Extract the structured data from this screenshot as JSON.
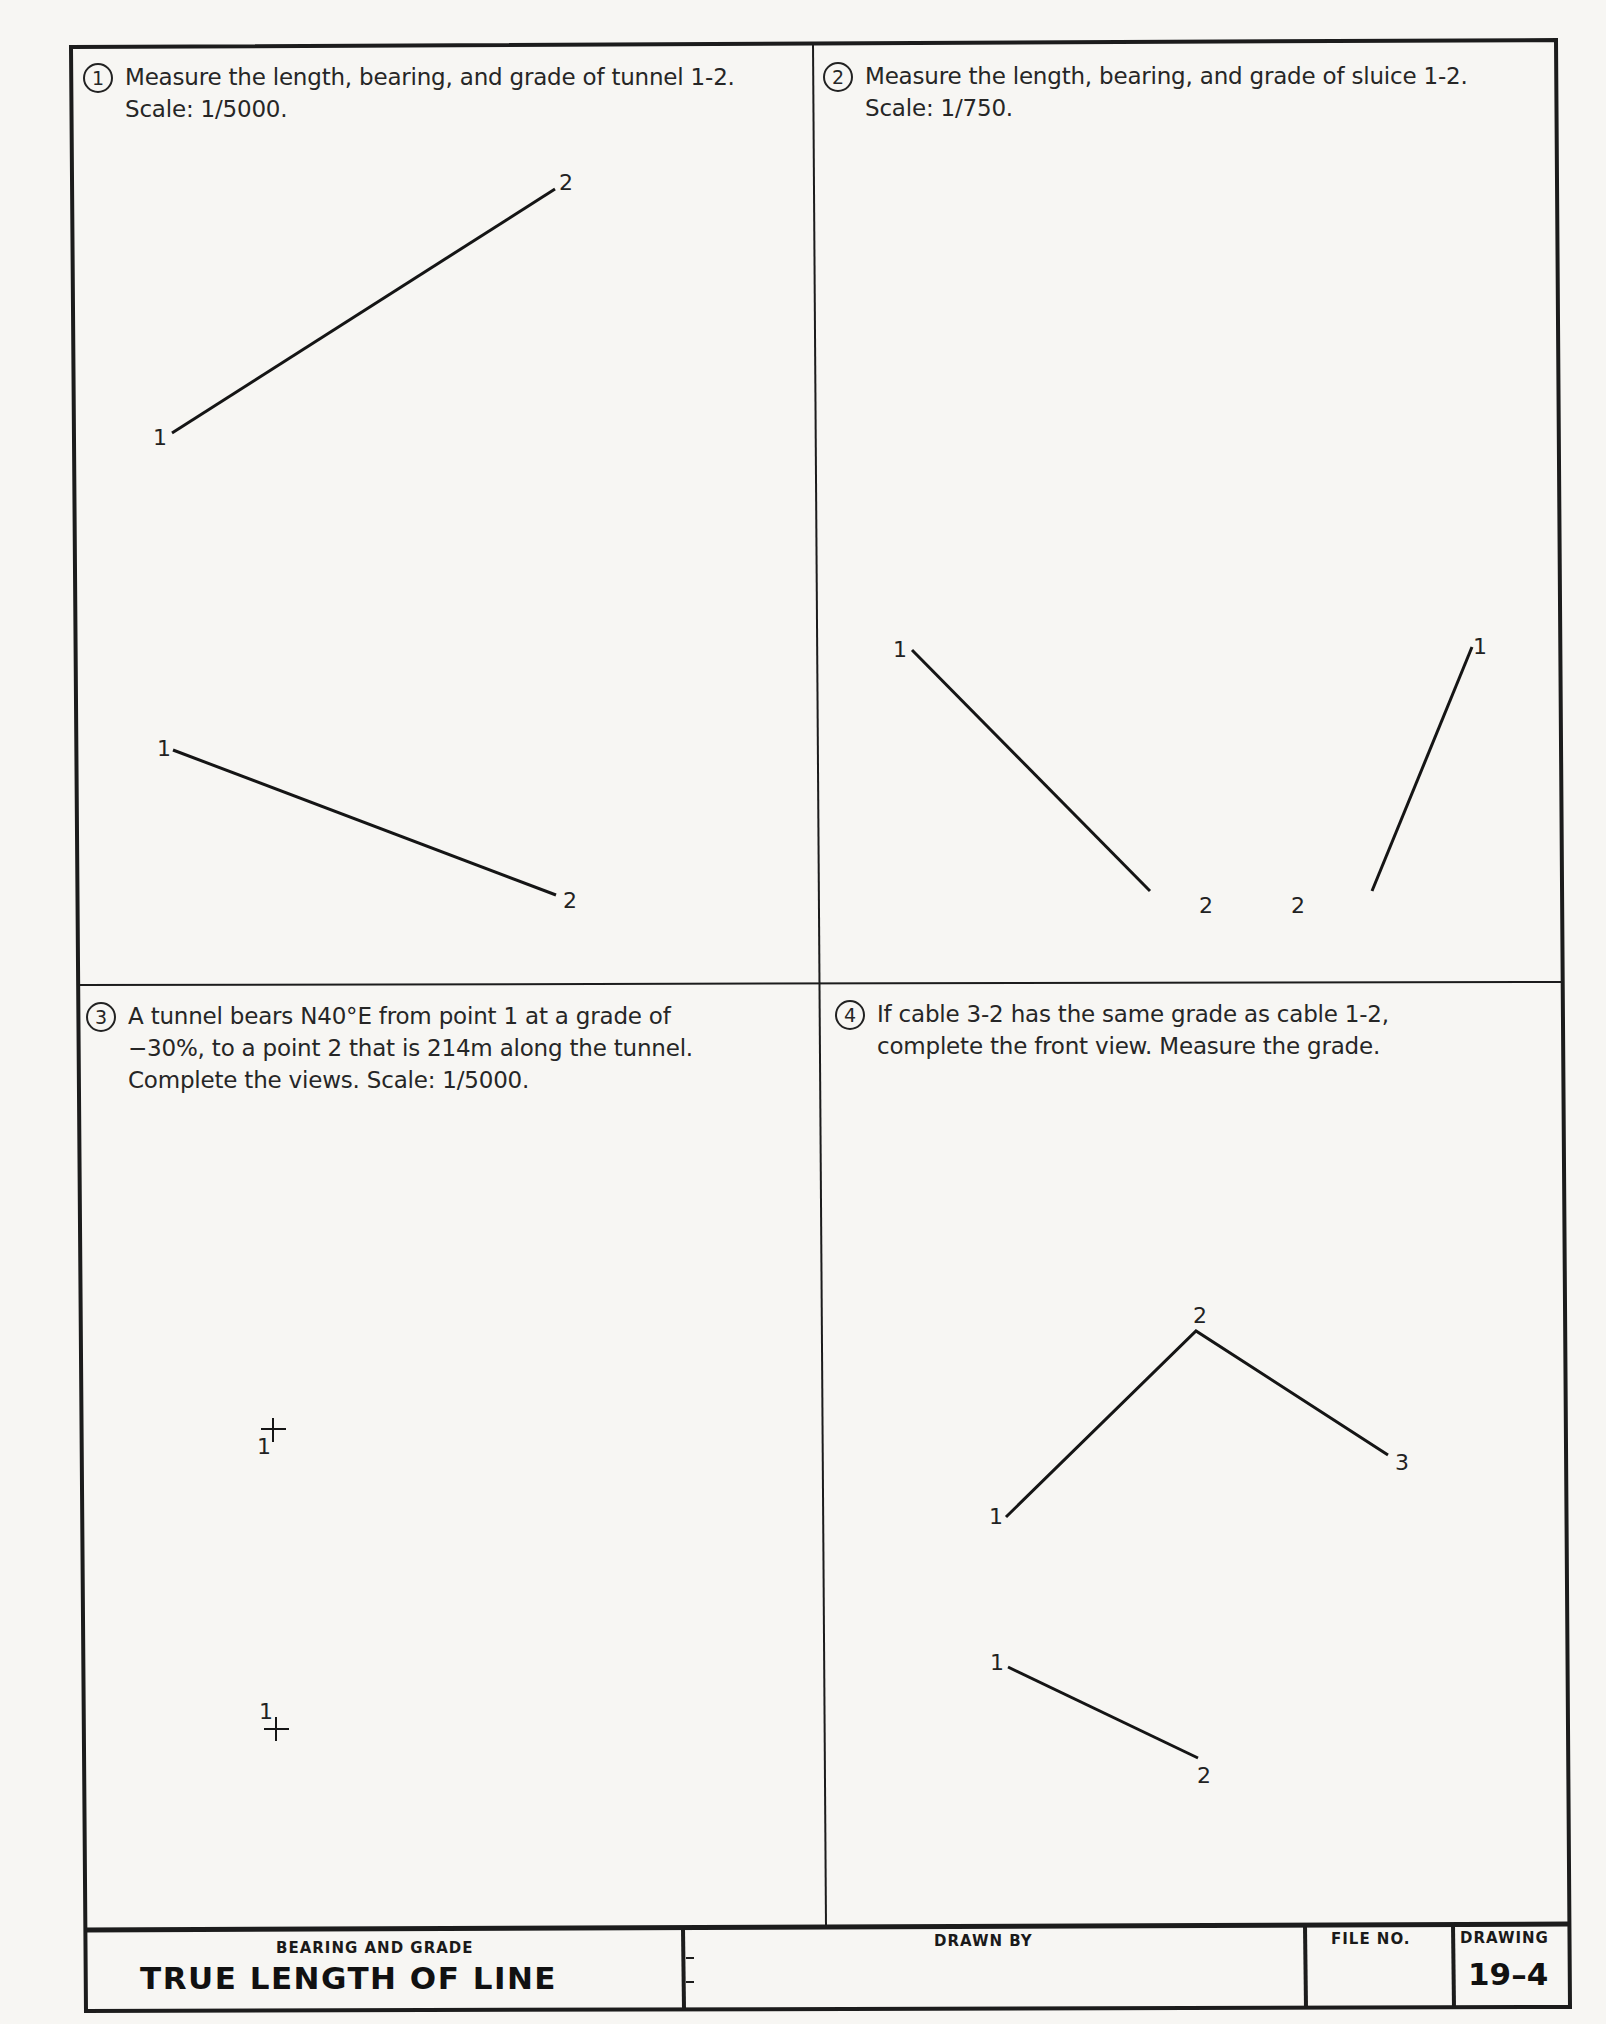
{
  "problems": [
    {
      "number": "1",
      "text": "Measure the length, bearing, and grade of tunnel 1-2.\nScale: 1/5000."
    },
    {
      "number": "2",
      "text": "Measure the length, bearing, and grade of sluice 1-2.\nScale: 1/750."
    },
    {
      "number": "3",
      "text": "A tunnel bears N40°E from point 1 at a grade of\n−30%, to a point 2 that is 214m along the tunnel.\nComplete the views. Scale: 1/5000."
    },
    {
      "number": "4",
      "text": "If cable 3-2 has the same grade as cable 1-2,\ncomplete the front view. Measure the grade."
    }
  ],
  "drawing_labels": {
    "p1_top_1": "1",
    "p1_top_2": "2",
    "p1_front_1": "1",
    "p1_front_2": "2",
    "p2_left_1": "1",
    "p2_left_2": "2",
    "p2_right_1": "1",
    "p2_right_2": "2",
    "p3_top_1": "1",
    "p3_front_1": "1",
    "p4_top_1": "1",
    "p4_top_2": "2",
    "p4_top_3": "3",
    "p4_front_1": "1",
    "p4_front_2": "2"
  },
  "title_block": {
    "subtitle": "BEARING AND GRADE",
    "title": "TRUE LENGTH OF LINE",
    "drawn_by_label": "DRAWN BY",
    "file_no_label": "FILE NO.",
    "drawing_label": "DRAWING",
    "drawing_number": "19–4"
  }
}
